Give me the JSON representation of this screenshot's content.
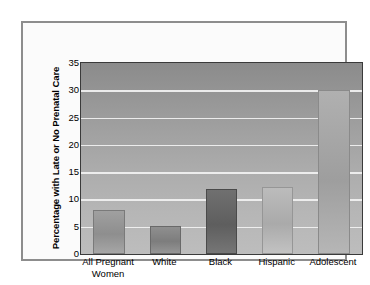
{
  "chart_data": {
    "type": "bar",
    "title": "",
    "subtitle": "",
    "xlabel": "",
    "ylabel": "Percentage with Late or No Prenatal Care",
    "categories": [
      "All Pregnant Women",
      "White",
      "Black",
      "Hispanic",
      "Adolescent"
    ],
    "category_lines": [
      [
        "All Pregnant",
        "Women"
      ],
      [
        "White"
      ],
      [
        "Black"
      ],
      [
        "Hispanic"
      ],
      [
        "Adolescent"
      ]
    ],
    "values": [
      8,
      5.2,
      12,
      12.3,
      30
    ],
    "ylim": [
      0,
      35
    ],
    "yticks": [
      0,
      5,
      10,
      15,
      20,
      25,
      30,
      35
    ],
    "ytick_labels": [
      "0",
      "5",
      "10",
      "15",
      "20",
      "25",
      "30",
      "35"
    ],
    "gridlines": [
      5,
      10,
      15,
      20,
      25,
      30
    ],
    "grid": true,
    "legend": false,
    "legend_position": "none",
    "bar_colors": [
      "#a0a0a0",
      "#8f8f8f",
      "#707070",
      "#bcbcbc",
      "#b0b0b0"
    ],
    "plot_background": "#9e9e9e",
    "gridline_color": "#f2f2f2",
    "axis_color": "#3a3a3a",
    "frame_color": "#8d8d8d",
    "page_background": "#ffffff"
  }
}
